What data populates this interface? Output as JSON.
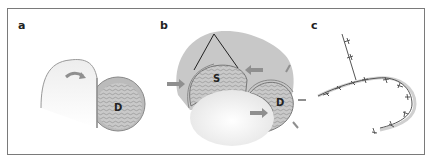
{
  "figure": {
    "panels": [
      {
        "id": "a",
        "label": "a",
        "regions": [
          {
            "label": "D"
          }
        ]
      },
      {
        "id": "b",
        "label": "b",
        "regions": [
          {
            "label": "S"
          },
          {
            "label": "D"
          }
        ]
      },
      {
        "id": "c",
        "label": "c"
      }
    ]
  },
  "colors": {
    "frame": "#7a7a7a",
    "shadow_region": "#c8c8c8",
    "flap_fill": "#bdbdbd",
    "arrow": "#8f8f8f",
    "skin_gradient_light": "#ffffff",
    "skin_gradient_dark": "#e2e2e2",
    "suture_line": "#555555"
  }
}
